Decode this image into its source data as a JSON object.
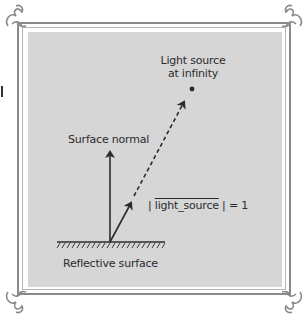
{
  "diagram": {
    "labels": {
      "light_source_line1": "Light source",
      "light_source_line2": "at infinity",
      "surface_normal": "Surface normal",
      "magnitude_prefix": "| ",
      "magnitude_var": "light_source",
      "magnitude_suffix": " | = 1",
      "reflective_surface": "Reflective surface"
    },
    "elements": {
      "surface_point": [
        110,
        242
      ],
      "surface_normal_tip": [
        110,
        150
      ],
      "unit_vector_tip": [
        132,
        201
      ],
      "dashed_arrow_tip": [
        185,
        100
      ],
      "light_source_point": [
        192,
        89
      ],
      "surface_line": {
        "x1": 57,
        "x2": 165,
        "y": 242
      }
    },
    "colors": {
      "panel": "#d6d6d6",
      "ink": "#2b2b2b",
      "frame": "#8a8a8a",
      "background": "#ffffff"
    },
    "decorations": {
      "corner_ornaments": [
        "top-left",
        "top-right",
        "bottom-left",
        "bottom-right"
      ]
    }
  }
}
